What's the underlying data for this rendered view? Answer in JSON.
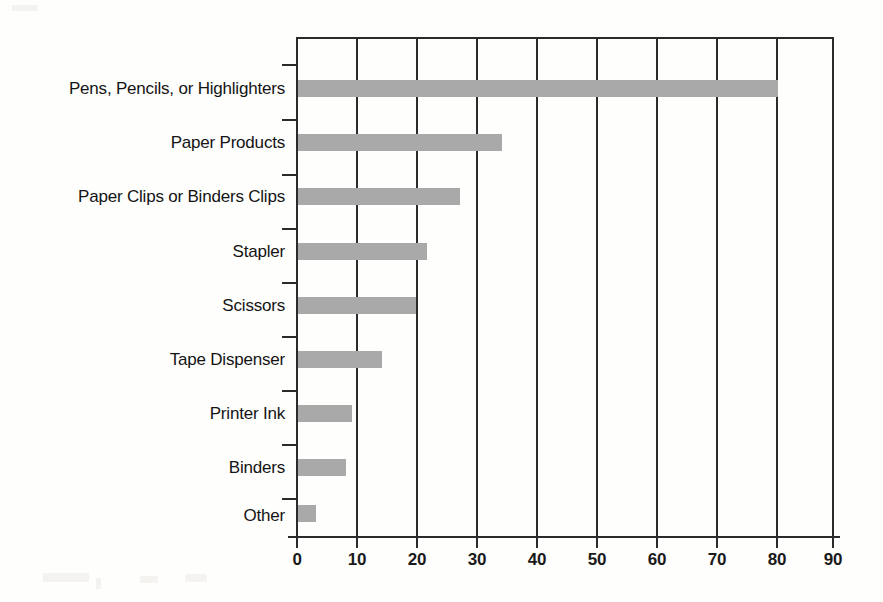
{
  "chart_data": {
    "type": "bar",
    "orientation": "horizontal",
    "title": "",
    "xlabel": "",
    "ylabel": "",
    "categories": [
      "Pens, Pencils, or Highlighters",
      "Paper Products",
      "Paper Clips or Binders Clips",
      "Stapler",
      "Scissors",
      "Tape Dispenser",
      "Printer Ink",
      "Binders",
      "Other"
    ],
    "values": [
      80,
      34,
      27,
      21.5,
      19.7,
      14,
      9,
      8,
      3
    ],
    "xlim": [
      0,
      90
    ],
    "xticks": [
      0,
      10,
      20,
      30,
      40,
      50,
      60,
      70,
      80,
      90
    ],
    "xtick_labels": [
      "0",
      "10",
      "20",
      "30",
      "40",
      "50",
      "60",
      "70",
      "80",
      "90"
    ],
    "grid": "vertical",
    "legend": "none",
    "bar_color": "#a9a9a9",
    "axis_color": "#2b2b2b"
  }
}
